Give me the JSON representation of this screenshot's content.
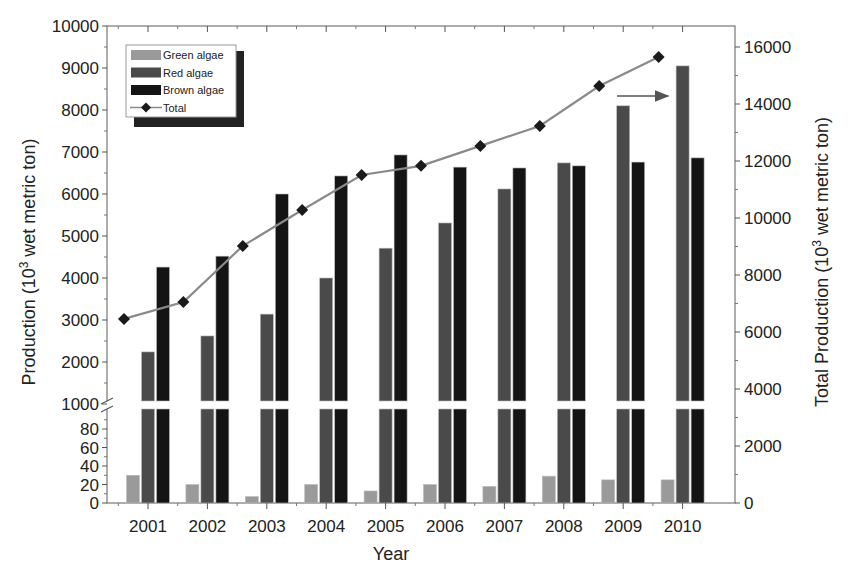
{
  "chart_data": {
    "type": "bar",
    "title": "",
    "xlabel": "Year",
    "ylabel": "Production (10³ wet metric ton)",
    "ylabel_right": "Total Production (10³ wet metric ton)",
    "categories": [
      "2001",
      "2002",
      "2003",
      "2004",
      "2005",
      "2006",
      "2007",
      "2008",
      "2009",
      "2010"
    ],
    "series": [
      {
        "name": "Green algae",
        "type": "bar",
        "axis": "left",
        "color": "#9a9a9a",
        "values": [
          30,
          20,
          7,
          20,
          13,
          20,
          18,
          29,
          25,
          25
        ]
      },
      {
        "name": "Red algae",
        "type": "bar",
        "axis": "left",
        "color": "#4a4a4a",
        "values": [
          2240,
          2620,
          3140,
          4000,
          4710,
          5310,
          6120,
          6740,
          8100,
          9050
        ]
      },
      {
        "name": "Brown algae",
        "type": "bar",
        "axis": "left",
        "color": "#141414",
        "values": [
          4260,
          4520,
          6000,
          6430,
          6930,
          6640,
          6620,
          6670,
          6760,
          6860
        ]
      },
      {
        "name": "Total",
        "type": "line",
        "axis": "right",
        "color": "#8a8a8a",
        "marker": "diamond",
        "values": [
          6460,
          7050,
          9020,
          10280,
          11510,
          11830,
          12530,
          13230,
          14630,
          15650
        ]
      }
    ],
    "left_axis": {
      "broken": true,
      "lower_range": [
        0,
        100
      ],
      "lower_ticks": [
        "0",
        "20",
        "40",
        "60",
        "80"
      ],
      "upper_range": [
        1000,
        10000
      ],
      "upper_ticks": [
        "1000",
        "2000",
        "3000",
        "4000",
        "5000",
        "6000",
        "7000",
        "8000",
        "9000",
        "10000"
      ]
    },
    "right_axis": {
      "range": [
        0,
        16000
      ],
      "ticks": [
        "0",
        "2000",
        "4000",
        "6000",
        "8000",
        "10000",
        "12000",
        "14000",
        "16000"
      ]
    },
    "legend": {
      "position": "upper-left",
      "entries": [
        "Green algae",
        "Red algae",
        "Brown algae",
        "Total"
      ]
    },
    "annotations": [
      "arrow pointing right from Total line toward right axis"
    ],
    "grid": false
  },
  "labels": {
    "xlabel": "Year",
    "ylabel_prefix": "Production (10",
    "ylabel_sup": "3",
    "ylabel_suffix": " wet metric ton)",
    "ylabel_right_prefix": "Total Production (10",
    "ylabel_right_sup": "3",
    "ylabel_right_suffix": " wet metric ton)"
  }
}
